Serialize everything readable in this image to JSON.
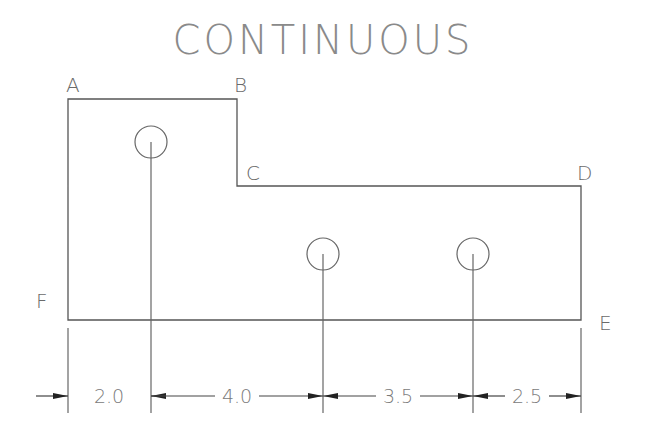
{
  "title": "CONTINUOUS",
  "vertices": [
    {
      "label": "A",
      "x": 68,
      "y": 99,
      "lx": 66,
      "ly": 92
    },
    {
      "label": "B",
      "x": 237,
      "y": 99,
      "lx": 234,
      "ly": 92
    },
    {
      "label": "C",
      "x": 237,
      "y": 186,
      "lx": 246,
      "ly": 180
    },
    {
      "label": "D",
      "x": 581,
      "y": 186,
      "lx": 577,
      "ly": 180
    },
    {
      "label": "E",
      "x": 581,
      "y": 320,
      "lx": 599,
      "ly": 330
    },
    {
      "label": "F",
      "x": 68,
      "y": 320,
      "lx": 36,
      "ly": 308
    }
  ],
  "holes": [
    {
      "cx": 151,
      "cy": 142,
      "r": 16
    },
    {
      "cx": 323,
      "cy": 254,
      "r": 16
    },
    {
      "cx": 473,
      "cy": 254,
      "r": 16
    }
  ],
  "dimensions": {
    "line_y": 396,
    "segments": [
      {
        "value": "2.0",
        "from": 68,
        "to": 151,
        "text_x": 109
      },
      {
        "value": "4.0",
        "from": 151,
        "to": 323,
        "text_x": 237
      },
      {
        "value": "3.5",
        "from": 323,
        "to": 473,
        "text_x": 398
      },
      {
        "value": "2.5",
        "from": 473,
        "to": 581,
        "text_x": 527
      }
    ]
  }
}
